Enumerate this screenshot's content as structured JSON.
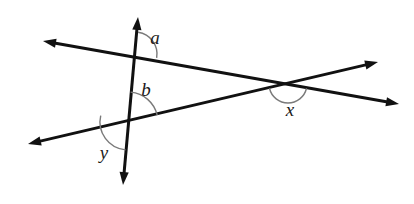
{
  "figure": {
    "kind": "geometry-diagram",
    "width": 414,
    "height": 204,
    "background_color": "#ffffff",
    "stroke_color": "#111111",
    "arc_color": "#7a7a7a",
    "label_color": "#1a1a1a",
    "line_width": 3,
    "arc_width": 1.4
  },
  "lines": [
    {
      "name": "vertical-transversal",
      "label": "vertical line",
      "x1": 138,
      "y1": 17,
      "x2": 123,
      "y2": 185,
      "arrow_start": true,
      "arrow_end": true
    },
    {
      "name": "upper-line",
      "label": "line from upper-left to lower-right",
      "x1": 43,
      "y1": 41,
      "x2": 399,
      "y2": 104,
      "arrow_start": true,
      "arrow_end": true
    },
    {
      "name": "lower-line",
      "label": "line from lower-left to upper-right",
      "x1": 28,
      "y1": 144,
      "x2": 378,
      "y2": 62,
      "arrow_start": true,
      "arrow_end": true
    }
  ],
  "intersections": [
    {
      "name": "top-intersection",
      "x": 135,
      "y": 54,
      "lines": [
        "vertical-transversal",
        "upper-line"
      ]
    },
    {
      "name": "bottom-intersection",
      "x": 128,
      "y": 122,
      "lines": [
        "vertical-transversal",
        "lower-line"
      ]
    },
    {
      "name": "right-intersection",
      "x": 288,
      "y": 84,
      "lines": [
        "upper-line",
        "lower-line"
      ]
    }
  ],
  "angles": [
    {
      "name": "angle-a",
      "label": "a",
      "vertex": {
        "x": 135,
        "y": 54
      },
      "label_x": 155,
      "label_y": 37,
      "arc_radius": 22,
      "arc_start_deg": -82,
      "arc_end_deg": 10
    },
    {
      "name": "angle-b",
      "label": "b",
      "vertex": {
        "x": 128,
        "y": 122
      },
      "label_x": 146,
      "label_y": 89,
      "arc_radius": 30,
      "arc_start_deg": -85,
      "arc_end_deg": -13
    },
    {
      "name": "angle-y",
      "label": "y",
      "vertex": {
        "x": 128,
        "y": 122
      },
      "label_x": 104,
      "label_y": 152,
      "arc_radius": 28,
      "arc_start_deg": 95,
      "arc_end_deg": 193
    },
    {
      "name": "angle-x",
      "label": "x",
      "vertex": {
        "x": 288,
        "y": 84
      },
      "label_x": 290,
      "label_y": 109,
      "arc_radius": 19,
      "arc_start_deg": 13,
      "arc_end_deg": 167
    }
  ]
}
